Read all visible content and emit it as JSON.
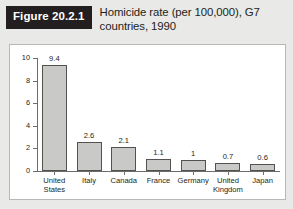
{
  "header": {
    "badge": "Figure 20.2.1",
    "title": "Homicide rate (per 100,000), G7 countries, 1990"
  },
  "colors": {
    "badge_background": "#231f20",
    "badge_text": "#ffffff",
    "page_background": "#e9e9e7",
    "panel_background": "#ffffff",
    "panel_border": "#b8b8b6",
    "bar_fill": "#c9c9c7",
    "bar_stroke": "#55514f",
    "axis": "#6d6d6d",
    "text": "#231f20"
  },
  "chart_data": {
    "type": "bar",
    "title": "Homicide rate (per 100,000), G7 countries, 1990",
    "xlabel": "",
    "ylabel": "",
    "ylim": [
      0,
      10
    ],
    "yticks": [
      0,
      2,
      4,
      6,
      8,
      10
    ],
    "ytick_labels": [
      "0",
      "2",
      "4",
      "6",
      "8",
      "10"
    ],
    "grid": false,
    "legend": false,
    "categories": [
      "United States",
      "Italy",
      "Canada",
      "France",
      "Germany",
      "United Kingdom",
      "Japan"
    ],
    "category_lines": [
      [
        "United",
        "States"
      ],
      [
        "Italy"
      ],
      [
        "Canada"
      ],
      [
        "France"
      ],
      [
        "Germany"
      ],
      [
        "United",
        "Kingdom"
      ],
      [
        "Japan"
      ]
    ],
    "values": [
      9.4,
      2.6,
      2.1,
      1.1,
      1,
      0.7,
      0.6
    ],
    "value_labels": [
      "9.4",
      "2.6",
      "2.1",
      "1.1",
      "1",
      "0.7",
      "0.6"
    ]
  }
}
